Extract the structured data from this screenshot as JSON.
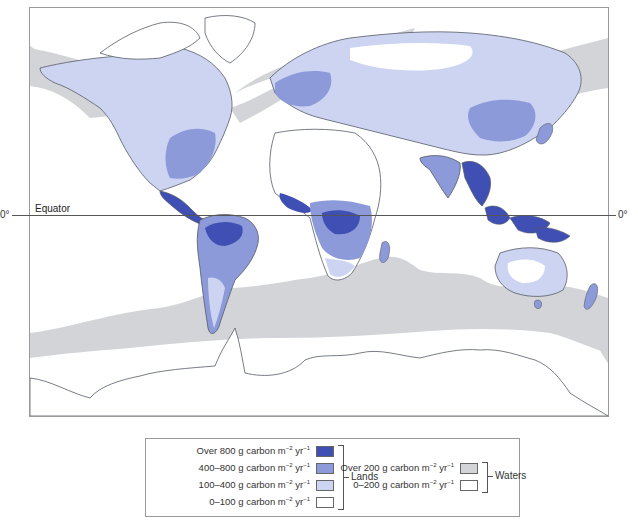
{
  "map": {
    "title": "",
    "equator_label": "Equator",
    "latitude_left": "0°",
    "latitude_right": "0°",
    "colors": {
      "land_over_800": "#3f4fb3",
      "land_400_800": "#8c9ad9",
      "land_100_400": "#cdd4f2",
      "land_0_100": "#ffffff",
      "water_over_200": "#d2d4d8",
      "water_0_200": "#ffffff",
      "coastline": "#555b66"
    }
  },
  "legend": {
    "lands": {
      "group_label": "Lands",
      "items": [
        {
          "label": "Over 800 g carbon m",
          "exp1": "−2",
          "unit2": " yr",
          "exp2": "−1",
          "color": "#3f4fb3"
        },
        {
          "label": "400–800 g carbon m",
          "exp1": "−2",
          "unit2": " yr",
          "exp2": "−1",
          "color": "#8c9ad9"
        },
        {
          "label": "100–400 g carbon m",
          "exp1": "−2",
          "unit2": " yr",
          "exp2": "−1",
          "color": "#cdd4f2"
        },
        {
          "label": "0–100 g carbon m",
          "exp1": "−2",
          "unit2": " yr",
          "exp2": "−1",
          "color": "#ffffff"
        }
      ]
    },
    "waters": {
      "group_label": "Waters",
      "items": [
        {
          "label": "Over 200 g carbon m",
          "exp1": "−2",
          "unit2": " yr",
          "exp2": "−1",
          "color": "#d2d4d8"
        },
        {
          "label": "0–200 g carbon m",
          "exp1": "−2",
          "unit2": " yr",
          "exp2": "−1",
          "color": "#ffffff"
        }
      ]
    }
  }
}
